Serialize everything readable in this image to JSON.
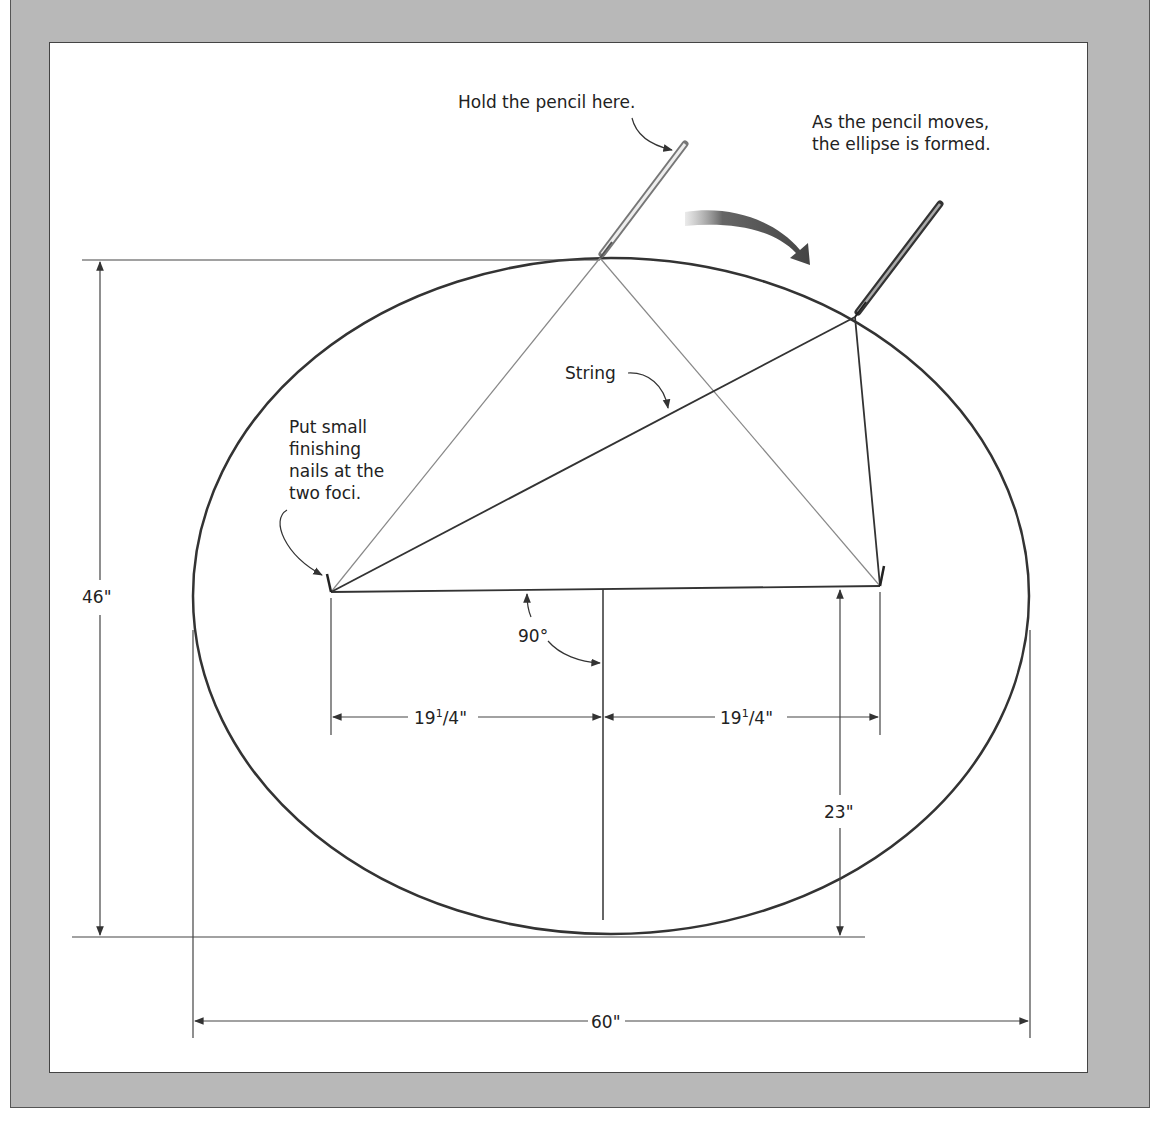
{
  "diagram": {
    "type": "ellipse-construction",
    "labels": {
      "hold_pencil": "Hold the pencil here.",
      "pencil_moves_line1": "As the pencil moves,",
      "pencil_moves_line2": "the ellipse is formed.",
      "string": "String",
      "nails_line1": "Put small",
      "nails_line2": "finishing",
      "nails_line3": "nails at the",
      "nails_line4": "two foci.",
      "right_angle": "90°"
    },
    "dimensions": {
      "height": "46\"",
      "width": "60\"",
      "half_height": "23\"",
      "focus_left_whole": "19",
      "focus_left_num": "1",
      "focus_left_den": "/4\"",
      "focus_right_whole": "19",
      "focus_right_num": "1",
      "focus_right_den": "/4\""
    },
    "geometry": {
      "ellipse_center": [
        611,
        596
      ],
      "ellipse_rx": 418,
      "ellipse_ry": 338,
      "focus_left": [
        331,
        592
      ],
      "focus_right": [
        880,
        586
      ],
      "pencil_top": [
        600,
        258
      ],
      "pencil_moving": [
        855,
        317
      ]
    },
    "colors": {
      "frame": "#b8b8b8",
      "panel": "#ffffff",
      "line": "#333333",
      "string_light": "#888888"
    }
  }
}
